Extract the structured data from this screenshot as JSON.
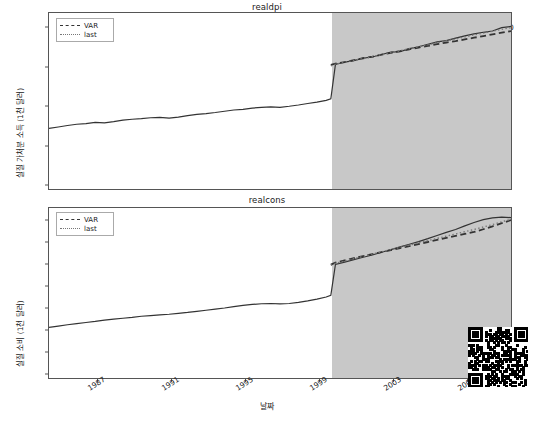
{
  "figure": {
    "width": 534,
    "height": 421,
    "background": "#ffffff",
    "forecast_shade_color": "#c8c8c8",
    "line_color": "#333333",
    "dotted_color": "#777777"
  },
  "xaxis": {
    "label": "날짜",
    "ticks": [
      "1987",
      "1991",
      "1995",
      "1999",
      "2003",
      "2007"
    ],
    "tick_positions_px": [
      97,
      171,
      245,
      319,
      393,
      467
    ],
    "range_years": [
      1984.5,
      2009.5
    ],
    "forecast_start": "1999.75",
    "forecast_start_px": 331
  },
  "legend": {
    "position": "upper-left",
    "entries": [
      {
        "label": "VAR",
        "style": "dashed"
      },
      {
        "label": "last",
        "style": "dotted"
      }
    ]
  },
  "overlay": {
    "qr_code": "qr-code-watermark"
  },
  "chart_data": [
    {
      "type": "line",
      "title": "realdpi",
      "xlabel": "날짜",
      "ylabel": "실질 가처분 소득 (1천 달러)",
      "ylim": [
        2000,
        10400
      ],
      "yticks": [
        2000,
        4000,
        6000,
        8000,
        10000
      ],
      "grid": false,
      "legend_position": "upper left",
      "x": [
        1984.5,
        1985.0,
        1985.5,
        1986.0,
        1986.5,
        1987.0,
        1987.5,
        1988.0,
        1988.5,
        1989.0,
        1989.5,
        1990.0,
        1990.5,
        1991.0,
        1991.5,
        1992.0,
        1992.5,
        1993.0,
        1993.5,
        1994.0,
        1994.5,
        1995.0,
        1995.5,
        1996.0,
        1996.5,
        1997.0,
        1997.5,
        1998.0,
        1998.5,
        1999.0,
        1999.5,
        1999.75,
        2000.0,
        2000.5,
        2001.0,
        2001.5,
        2002.0,
        2002.5,
        2003.0,
        2003.5,
        2004.0,
        2004.5,
        2005.0,
        2005.5,
        2006.0,
        2006.5,
        2007.0,
        2007.5,
        2008.0,
        2008.5,
        2009.0,
        2009.5
      ],
      "series": [
        {
          "name": "actual",
          "style": "solid",
          "values": [
            4890,
            4960,
            5030,
            5090,
            5120,
            5180,
            5160,
            5220,
            5290,
            5330,
            5360,
            5400,
            5420,
            5380,
            5430,
            5500,
            5560,
            5600,
            5650,
            5710,
            5770,
            5800,
            5860,
            5900,
            5920,
            5900,
            5950,
            6010,
            6080,
            6150,
            6230,
            6300,
            7940,
            8060,
            8130,
            8250,
            8300,
            8420,
            8530,
            8560,
            8700,
            8790,
            8900,
            9020,
            9080,
            9200,
            9310,
            9400,
            9480,
            9540,
            9700,
            9760
          ]
        },
        {
          "name": "VAR",
          "style": "dashed",
          "values": [
            null,
            null,
            null,
            null,
            null,
            null,
            null,
            null,
            null,
            null,
            null,
            null,
            null,
            null,
            null,
            null,
            null,
            null,
            null,
            null,
            null,
            null,
            null,
            null,
            null,
            null,
            null,
            null,
            null,
            null,
            null,
            7920,
            7980,
            8060,
            8150,
            8240,
            8320,
            8410,
            8500,
            8580,
            8670,
            8750,
            8830,
            8910,
            8990,
            9060,
            9140,
            9220,
            9300,
            9380,
            9460,
            9540
          ]
        },
        {
          "name": "last",
          "style": "dotted",
          "values": [
            null,
            null,
            null,
            null,
            null,
            null,
            null,
            null,
            null,
            null,
            null,
            null,
            null,
            null,
            null,
            null,
            null,
            null,
            null,
            null,
            null,
            null,
            null,
            null,
            null,
            null,
            null,
            null,
            null,
            null,
            null,
            7880,
            7960,
            8040,
            8140,
            8230,
            8320,
            8420,
            8510,
            8600,
            8700,
            8790,
            8880,
            8980,
            9070,
            9160,
            9260,
            9350,
            9440,
            9530,
            9620,
            9700
          ]
        }
      ]
    },
    {
      "type": "line",
      "title": "realcons",
      "xlabel": "날짜",
      "ylabel": "실질 소비 (1천 달러)",
      "ylim": [
        2000,
        9600
      ],
      "yticks": [
        2000,
        3000,
        4000,
        5000,
        6000,
        7000,
        8000,
        9000
      ],
      "grid": false,
      "legend_position": "upper left",
      "x": [
        1984.5,
        1985.0,
        1985.5,
        1986.0,
        1986.5,
        1987.0,
        1987.5,
        1988.0,
        1988.5,
        1989.0,
        1989.5,
        1990.0,
        1990.5,
        1991.0,
        1991.5,
        1992.0,
        1992.5,
        1993.0,
        1993.5,
        1994.0,
        1994.5,
        1995.0,
        1995.5,
        1996.0,
        1996.5,
        1997.0,
        1997.5,
        1998.0,
        1998.5,
        1999.0,
        1999.5,
        1999.75,
        2000.0,
        2000.5,
        2001.0,
        2001.5,
        2002.0,
        2002.5,
        2003.0,
        2003.5,
        2004.0,
        2004.5,
        2005.0,
        2005.5,
        2006.0,
        2006.5,
        2007.0,
        2007.5,
        2008.0,
        2008.5,
        2009.0,
        2009.5
      ],
      "series": [
        {
          "name": "actual",
          "style": "solid",
          "values": [
            4260,
            4320,
            4380,
            4430,
            4480,
            4530,
            4590,
            4630,
            4670,
            4710,
            4760,
            4790,
            4820,
            4850,
            4890,
            4930,
            4980,
            5030,
            5080,
            5130,
            5190,
            5250,
            5290,
            5320,
            5330,
            5310,
            5330,
            5380,
            5450,
            5530,
            5620,
            5700,
            7080,
            7180,
            7290,
            7400,
            7500,
            7620,
            7740,
            7860,
            7980,
            8100,
            8230,
            8370,
            8510,
            8640,
            8800,
            8950,
            9080,
            9160,
            9190,
            9170
          ]
        },
        {
          "name": "VAR",
          "style": "dashed",
          "values": [
            null,
            null,
            null,
            null,
            null,
            null,
            null,
            null,
            null,
            null,
            null,
            null,
            null,
            null,
            null,
            null,
            null,
            null,
            null,
            null,
            null,
            null,
            null,
            null,
            null,
            null,
            null,
            null,
            null,
            null,
            null,
            7070,
            7160,
            7260,
            7360,
            7450,
            7540,
            7630,
            7720,
            7810,
            7900,
            7990,
            8080,
            8170,
            8260,
            8350,
            8440,
            8530,
            8650,
            8780,
            8920,
            9060
          ]
        },
        {
          "name": "last",
          "style": "dotted",
          "values": [
            null,
            null,
            null,
            null,
            null,
            null,
            null,
            null,
            null,
            null,
            null,
            null,
            null,
            null,
            null,
            null,
            null,
            null,
            null,
            null,
            null,
            null,
            null,
            null,
            null,
            null,
            null,
            null,
            null,
            null,
            null,
            7040,
            7130,
            7230,
            7340,
            7440,
            7540,
            7640,
            7740,
            7840,
            7940,
            8040,
            8140,
            8240,
            8340,
            8440,
            8540,
            8640,
            8750,
            8860,
            8980,
            9100
          ]
        }
      ]
    }
  ]
}
